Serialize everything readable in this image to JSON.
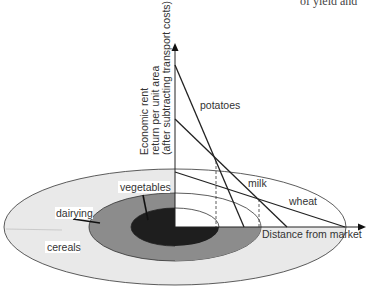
{
  "figure": {
    "corner_text": "of yield and",
    "y_axis_label": {
      "line1": "Economic rent",
      "line2": "return per unit area",
      "line3": "(after subtracting transport costs)"
    },
    "x_axis_label": "Distance from market",
    "curves": [
      {
        "name": "potatoes",
        "label": "potatoes"
      },
      {
        "name": "milk",
        "label": "milk"
      },
      {
        "name": "wheat",
        "label": "wheat"
      }
    ],
    "zones": [
      {
        "name": "vegetables",
        "label": "vegetables",
        "color": "#1e1e1e"
      },
      {
        "name": "dairying",
        "label": "dairying",
        "color": "#8a8a8a"
      },
      {
        "name": "cereals",
        "label": "cereals",
        "color": "#e8e8e8"
      }
    ]
  }
}
